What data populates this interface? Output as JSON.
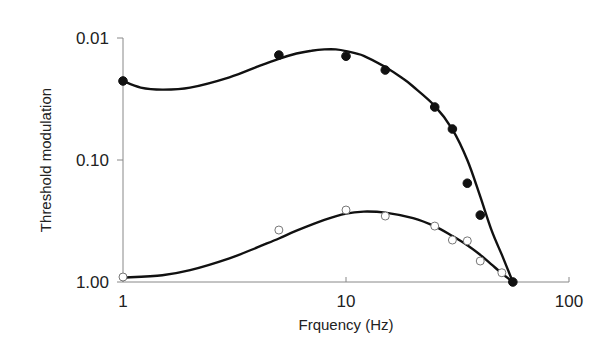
{
  "chart_data": {
    "type": "scatter",
    "title": "",
    "xlabel": "Frquency (Hz)",
    "ylabel": "Threshold modulation",
    "xscale": "log",
    "yscale": "log",
    "y_inverted": true,
    "xlim": [
      1,
      100
    ],
    "ylim": [
      0.01,
      1.0
    ],
    "xticks": [
      1,
      10,
      100
    ],
    "xtick_labels": [
      "1",
      "10",
      "100"
    ],
    "yticks": [
      0.01,
      0.1,
      1.0
    ],
    "ytick_labels": [
      "0.01",
      "0.10",
      "1.00"
    ],
    "grid": false,
    "legend": null,
    "series": [
      {
        "name": "filled",
        "marker": "filled-circle",
        "x": [
          1,
          5,
          10,
          15,
          25,
          30,
          35,
          40,
          56
        ],
        "y": [
          0.0225,
          0.0138,
          0.0141,
          0.0183,
          0.0368,
          0.0557,
          0.155,
          0.283,
          1.0
        ],
        "fit_curve": {
          "x": [
            1,
            1.2,
            1.5,
            2,
            3,
            4,
            5,
            6,
            7,
            8,
            9,
            10,
            12,
            15,
            18,
            20,
            25,
            30,
            35,
            40,
            45,
            50,
            56
          ],
          "y": [
            0.0225,
            0.0255,
            0.0265,
            0.0255,
            0.021,
            0.0172,
            0.0148,
            0.0134,
            0.0127,
            0.0124,
            0.0124,
            0.0128,
            0.014,
            0.0173,
            0.0215,
            0.025,
            0.036,
            0.056,
            0.1,
            0.2,
            0.38,
            0.6,
            1.0
          ]
        }
      },
      {
        "name": "open",
        "marker": "open-circle",
        "x": [
          1,
          5,
          10,
          15,
          25,
          30,
          35,
          40,
          50
        ],
        "y": [
          0.91,
          0.375,
          0.257,
          0.288,
          0.348,
          0.453,
          0.46,
          0.673,
          0.84
        ],
        "fit_curve": {
          "x": [
            1,
            1.5,
            2,
            3,
            4,
            5,
            6,
            8,
            10,
            12,
            15,
            20,
            25,
            30,
            35,
            40,
            45,
            50,
            56
          ],
          "y": [
            0.92,
            0.88,
            0.8,
            0.64,
            0.52,
            0.44,
            0.38,
            0.31,
            0.275,
            0.265,
            0.27,
            0.3,
            0.35,
            0.42,
            0.5,
            0.6,
            0.72,
            0.85,
            1.0
          ]
        }
      }
    ]
  }
}
